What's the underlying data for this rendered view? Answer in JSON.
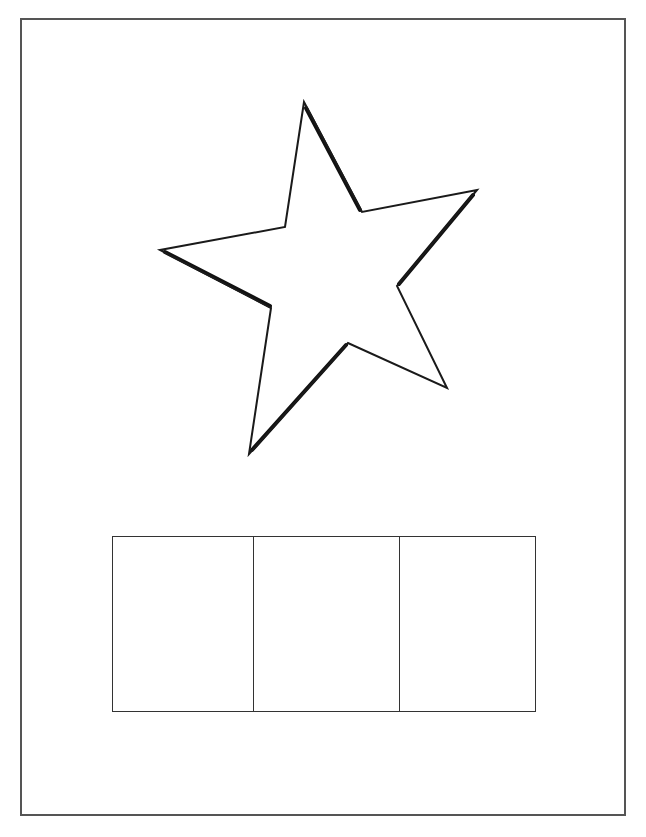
{
  "page": {
    "width": 646,
    "height": 837,
    "background": "#ffffff",
    "frame_color": "#555555"
  },
  "star": {
    "shape": "five-point-star",
    "stroke": "#1a1a1a",
    "fill": "#ffffff",
    "points": [
      [
        304,
        102
      ],
      [
        362,
        212
      ],
      [
        477,
        190
      ],
      [
        397,
        286
      ],
      [
        447,
        388
      ],
      [
        348,
        343
      ],
      [
        249,
        454
      ],
      [
        271,
        308
      ],
      [
        160,
        250
      ],
      [
        285,
        227
      ]
    ]
  },
  "answer_boxes": {
    "count": 3,
    "widths": [
      140,
      146,
      138
    ],
    "boxes": [
      {
        "label": ""
      },
      {
        "label": ""
      },
      {
        "label": ""
      }
    ]
  }
}
